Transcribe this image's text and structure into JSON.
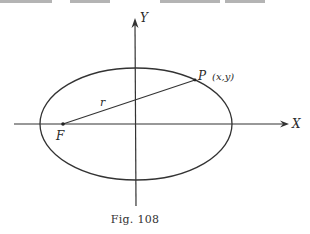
{
  "figure": {
    "caption": "Fig. 108",
    "axes": {
      "x_label": "X",
      "y_label": "Y"
    },
    "points": {
      "focus_label": "F",
      "point_label": "P",
      "point_coords": "(x,y)"
    },
    "segment_label": "r",
    "shape": "ellipse"
  },
  "colors": {
    "ink": "#2a2a2a",
    "background": "#ffffff"
  }
}
